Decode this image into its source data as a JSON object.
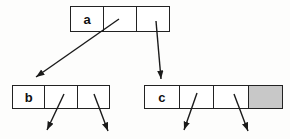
{
  "diagram": {
    "type": "tree-of-pointer-nodes",
    "nodes": [
      {
        "id": "a",
        "label": "a",
        "cell_count": 3,
        "shaded_cell_index": null
      },
      {
        "id": "b",
        "label": "b",
        "cell_count": 3,
        "shaded_cell_index": null
      },
      {
        "id": "c",
        "label": "c",
        "cell_count": 4,
        "shaded_cell_index": 3
      }
    ],
    "edges": [
      {
        "from": "a.cell2",
        "to": "node-b"
      },
      {
        "from": "a.cell3",
        "to": "node-c"
      },
      {
        "from": "b.cell2",
        "to": "below-left"
      },
      {
        "from": "b.cell3",
        "to": "below-right"
      },
      {
        "from": "c.cell2",
        "to": "below-left"
      },
      {
        "from": "c.cell3",
        "to": "below-right"
      }
    ],
    "colors": {
      "shaded_cell": "#c8c8c8",
      "line": "#1a1a1a",
      "cell_fill": "#ffffff",
      "background": "#fdfdfc"
    }
  }
}
